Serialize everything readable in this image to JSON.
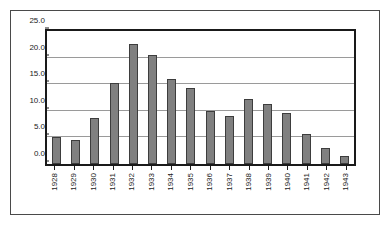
{
  "chart_data": {
    "type": "bar",
    "title": "",
    "subtitle": "",
    "xlabel": "",
    "ylabel": "",
    "categories": [
      "1928",
      "1929",
      "1930",
      "1931",
      "1932",
      "1933",
      "1934",
      "1935",
      "1936",
      "1937",
      "1938",
      "1939",
      "1940",
      "1941",
      "1942",
      "1943"
    ],
    "values": [
      5.1,
      4.5,
      8.6,
      15.2,
      22.5,
      20.5,
      16.0,
      14.2,
      10.0,
      9.0,
      12.3,
      11.2,
      9.5,
      5.7,
      3.0,
      1.6
    ],
    "ylim": [
      0.0,
      25.0
    ],
    "ytick_values": [
      0.0,
      5.0,
      10.0,
      15.0,
      20.0,
      25.0
    ],
    "ytick_labels": [
      "0.0",
      "5.0",
      "10.0",
      "15.0",
      "20.0",
      "25.0"
    ],
    "grid": true,
    "grid_axis": "y",
    "legend": false,
    "legend_position": "none",
    "annotations": [],
    "bar_color": "#808080",
    "bar_border_color": "#3d3d3d",
    "gridline_color": "#9a9a9a",
    "axis_color": "#1a1a1a",
    "frame_color": "#4a4a4a",
    "background_color": "#ffffff"
  }
}
